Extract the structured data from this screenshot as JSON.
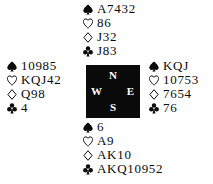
{
  "diagram": {
    "type": "bridge-hand-diagram",
    "colors": {
      "background": "#ffffff",
      "ink": "#0b0b0b",
      "compass_background": "#0a0a0a",
      "compass_text": "#ffffff"
    },
    "suit_order": [
      "spade",
      "heart",
      "diamond",
      "club"
    ],
    "suit_symbols": {
      "spade": "♠",
      "heart": "♡",
      "diamond": "♢",
      "club": "♣"
    },
    "compass": {
      "north": "N",
      "west": "W",
      "east": "E",
      "south": "S"
    },
    "hands": {
      "north": {
        "label": "North",
        "spades": "A7432",
        "hearts": "86",
        "diamonds": "J32",
        "clubs": "J83"
      },
      "west": {
        "label": "West",
        "spades": "10985",
        "hearts": "KQJ42",
        "diamonds": "Q98",
        "clubs": "4"
      },
      "east": {
        "label": "East",
        "spades": "KQJ",
        "hearts": "10753",
        "diamonds": "7654",
        "clubs": "76"
      },
      "south": {
        "label": "South",
        "spades": "6",
        "hearts": "A9",
        "diamonds": "AK10",
        "clubs": "AKQ10952"
      }
    }
  }
}
